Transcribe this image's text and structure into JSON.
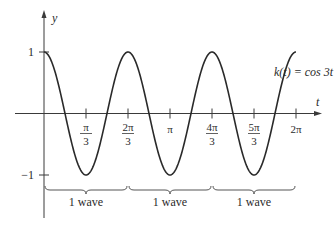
{
  "chart_data": {
    "type": "line",
    "title": "",
    "function_label": "k(t) = cos 3t",
    "xlabel": "t",
    "ylabel": "y",
    "xlim": [
      0,
      6.2832
    ],
    "ylim": [
      -1,
      1
    ],
    "grid": false,
    "legend": "none",
    "x_ticks": [
      {
        "value": 1.0472,
        "num": "π",
        "den": "3"
      },
      {
        "value": 2.0944,
        "num": "2π",
        "den": "3"
      },
      {
        "value": 3.1416,
        "label": "π"
      },
      {
        "value": 4.1888,
        "num": "4π",
        "den": "3"
      },
      {
        "value": 5.236,
        "num": "5π",
        "den": "3"
      },
      {
        "value": 6.2832,
        "label": "2π"
      }
    ],
    "y_ticks": [
      {
        "value": 1,
        "label": "1"
      },
      {
        "value": -1,
        "label": "−1"
      }
    ],
    "series": [
      {
        "name": "k(t) = cos 3t",
        "x": [
          0,
          0.5236,
          1.0472,
          1.5708,
          2.0944,
          2.618,
          3.1416,
          3.6652,
          4.1888,
          4.7124,
          5.236,
          5.7596,
          6.2832
        ],
        "values": [
          1,
          0,
          -1,
          0,
          1,
          0,
          -1,
          0,
          1,
          0,
          -1,
          0,
          1
        ]
      }
    ],
    "annotations": [
      {
        "type": "brace",
        "from": 0,
        "to": 2.0944,
        "label": "1 wave"
      },
      {
        "type": "brace",
        "from": 2.0944,
        "to": 4.1888,
        "label": "1 wave"
      },
      {
        "type": "brace",
        "from": 4.1888,
        "to": 6.2832,
        "label": "1 wave"
      }
    ]
  },
  "labels": {
    "y_axis": "y",
    "x_axis": "t",
    "function": "k(t) = cos 3t",
    "brace": "1 wave"
  }
}
